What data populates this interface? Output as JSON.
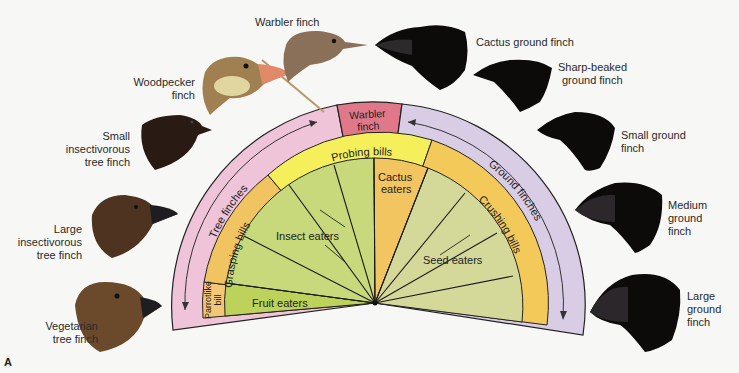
{
  "figure_label": "A",
  "groups": {
    "tree": "Tree finches",
    "warbler": [
      "Warbler",
      "finch"
    ],
    "ground": "Ground finches"
  },
  "bills": {
    "parrotlike": [
      "Parrotlike",
      "bill"
    ],
    "grasping": "Grasping bills",
    "probing": "Probing bills",
    "cactus_bill": "",
    "crushing": "Crushing bills"
  },
  "diets": {
    "fruit": "Fruit eaters",
    "insect": "Insect eaters",
    "cactus": [
      "Cactus",
      "eaters"
    ],
    "seed": "Seed eaters"
  },
  "birds": [
    {
      "name": [
        "Vegetarian",
        "tree finch"
      ],
      "color": "#6a4a2a"
    },
    {
      "name": [
        "Large",
        "insectivorous",
        "tree finch"
      ],
      "color": "#4e3320"
    },
    {
      "name": [
        "Small",
        "insectivorous",
        "tree finch"
      ],
      "color": "#2a1a14"
    },
    {
      "name": [
        "Woodpecker",
        "finch"
      ],
      "color": "#a08050"
    },
    {
      "name": [
        "Warbler finch"
      ],
      "color": "#8a7058"
    },
    {
      "name": [
        "Cactus ground finch"
      ],
      "color": "#0d0a0a"
    },
    {
      "name": [
        "Sharp-beaked",
        "ground finch"
      ],
      "color": "#0d0a0a"
    },
    {
      "name": [
        "Small ground",
        "finch"
      ],
      "color": "#0d0a0a"
    },
    {
      "name": [
        "Medium",
        "ground",
        "finch"
      ],
      "color": "#0d0a0a"
    },
    {
      "name": [
        "Large",
        "ground",
        "finch"
      ],
      "color": "#0d0a0a"
    }
  ],
  "colors": {
    "tree_ring": "#efc3d8",
    "warbler": "#e0788a",
    "ground_ring": "#d9cde6",
    "probing": "#f4ef5a",
    "grasping": "#f0c460",
    "crushing": "#f3c95a",
    "insect": "#c7d97a",
    "fruit": "#bcd25a",
    "cactus": "#f2c561",
    "seed": "#d4d99a"
  }
}
